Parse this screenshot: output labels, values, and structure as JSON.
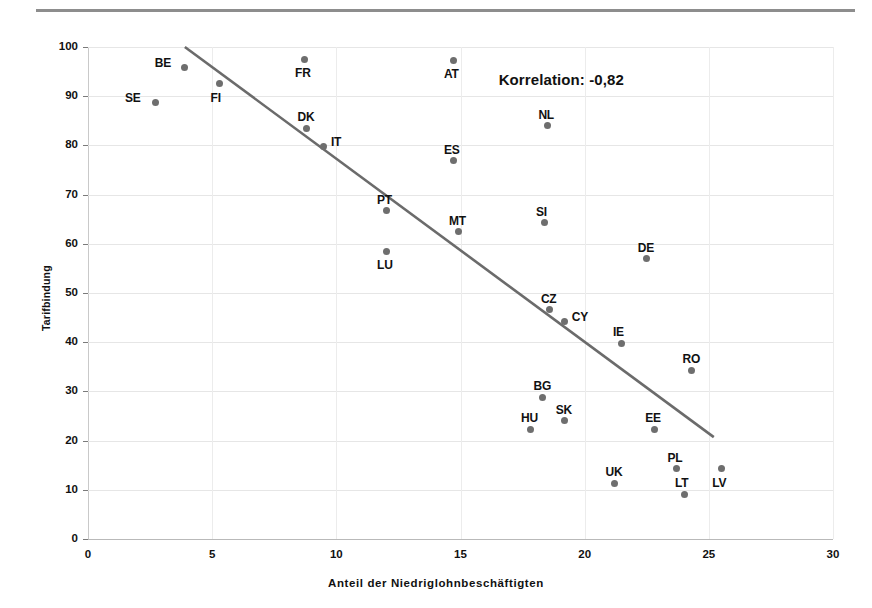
{
  "chart_data": {
    "type": "scatter",
    "title": "",
    "xlabel": "Anteil der Niedriglohnbeschäftigten",
    "ylabel": "Tarifbindung",
    "xlim": [
      0,
      30
    ],
    "ylim": [
      0,
      100
    ],
    "xticks": [
      0,
      5,
      10,
      15,
      20,
      25,
      30
    ],
    "yticks": [
      0,
      10,
      20,
      30,
      40,
      50,
      60,
      70,
      80,
      90,
      100
    ],
    "grid": true,
    "legend": "none",
    "annotations": [
      {
        "text": "Korrelation: -0,82",
        "x": 20.0,
        "y": 93.0
      }
    ],
    "trendline": {
      "type": "linear",
      "x_start": 3.9,
      "y_start": 100.0,
      "x_end": 25.2,
      "y_end": 20.7
    },
    "point_label_offsets": {
      "SE": "left",
      "BE": "left",
      "FI": "below",
      "FR": "below",
      "AT": "below",
      "DK": "above",
      "IT": "right",
      "NL": "above",
      "ES": "above",
      "PT": "above",
      "MT": "above",
      "SI": "above",
      "LU": "below",
      "DE": "above",
      "CZ": "above",
      "CY": "right",
      "IE": "above",
      "RO": "above",
      "BG": "above",
      "SK": "above",
      "HU": "above",
      "EE": "above",
      "PL": "above",
      "UK": "above",
      "LT": "above",
      "LV": "below"
    },
    "points": [
      {
        "label": "SE",
        "x": 2.7,
        "y": 88.8
      },
      {
        "label": "BE",
        "x": 3.9,
        "y": 95.9
      },
      {
        "label": "FI",
        "x": 5.3,
        "y": 92.5
      },
      {
        "label": "FR",
        "x": 8.7,
        "y": 97.5
      },
      {
        "label": "DK",
        "x": 8.8,
        "y": 83.5
      },
      {
        "label": "IT",
        "x": 9.5,
        "y": 79.8
      },
      {
        "label": "PT",
        "x": 12.0,
        "y": 66.7
      },
      {
        "label": "LU",
        "x": 12.0,
        "y": 58.5
      },
      {
        "label": "AT",
        "x": 14.7,
        "y": 97.3
      },
      {
        "label": "ES",
        "x": 14.7,
        "y": 76.9
      },
      {
        "label": "MT",
        "x": 14.9,
        "y": 62.4
      },
      {
        "label": "NL",
        "x": 18.5,
        "y": 84.0
      },
      {
        "label": "SI",
        "x": 18.4,
        "y": 64.3
      },
      {
        "label": "CZ",
        "x": 18.6,
        "y": 46.6
      },
      {
        "label": "CY",
        "x": 19.2,
        "y": 44.3
      },
      {
        "label": "BG",
        "x": 18.3,
        "y": 28.8
      },
      {
        "label": "SK",
        "x": 19.2,
        "y": 24.0
      },
      {
        "label": "HU",
        "x": 17.8,
        "y": 22.3
      },
      {
        "label": "IE",
        "x": 21.5,
        "y": 39.8
      },
      {
        "label": "UK",
        "x": 21.2,
        "y": 11.3
      },
      {
        "label": "DE",
        "x": 22.5,
        "y": 57.0
      },
      {
        "label": "EE",
        "x": 22.8,
        "y": 22.3
      },
      {
        "label": "PL",
        "x": 23.7,
        "y": 14.3
      },
      {
        "label": "LT",
        "x": 24.0,
        "y": 9.1
      },
      {
        "label": "RO",
        "x": 24.3,
        "y": 34.3
      },
      {
        "label": "LV",
        "x": 25.5,
        "y": 14.3
      }
    ]
  },
  "axis": {
    "y_tick_labels": [
      "0",
      "10",
      "20",
      "30",
      "40",
      "50",
      "60",
      "70",
      "80",
      "90",
      "100"
    ],
    "x_tick_labels": [
      "0",
      "5",
      "10",
      "15",
      "20",
      "25",
      "30"
    ],
    "y_title": "Tarifbindung",
    "x_title": "Anteil der Niedriglohnbeschäftigten"
  },
  "annotation": {
    "correlation_text": "Korrelation: -0,82"
  },
  "colors": {
    "marker": "#6e6e6e",
    "trendline": "#6b6b6b",
    "grid": "#e6e6e6",
    "axis": "#b9b9b9",
    "text": "#111111",
    "top_rule": "#8d8d8d"
  }
}
